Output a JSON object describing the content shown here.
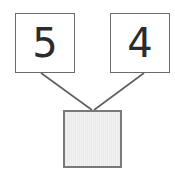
{
  "diagram": {
    "type": "number-bond",
    "background_color": "#ffffff",
    "addends": [
      {
        "id": "left",
        "value": "5",
        "box_fill": "#ffffff",
        "box_border_color": "#6b6b6b",
        "text_color": "#2b2b2b"
      },
      {
        "id": "right",
        "value": "4",
        "box_fill": "#ffffff",
        "box_border_color": "#6b6b6b",
        "text_color": "#2b2b2b"
      }
    ],
    "sum": {
      "id": "sum",
      "value": "",
      "state": "empty",
      "fill_color": "#ededed",
      "border_color": "#7a7a7a"
    },
    "connectors": [
      {
        "id": "left-to-sum",
        "from": "left",
        "to": "sum",
        "color": "#5f5f5f",
        "width": 1.6,
        "x1": 41,
        "y1": 73,
        "x2": 92,
        "y2": 110
      },
      {
        "id": "right-to-sum",
        "from": "right",
        "to": "sum",
        "color": "#5f5f5f",
        "width": 1.6,
        "x1": 144,
        "y1": 73,
        "x2": 94,
        "y2": 110
      }
    ]
  }
}
